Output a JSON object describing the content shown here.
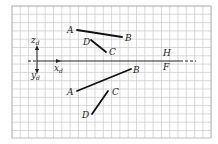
{
  "diagram": {
    "grid": {
      "x0": 12,
      "y0": 6,
      "x1": 211,
      "y1": 138,
      "spacing": 8.3,
      "color": "#c8c8c8",
      "border": "#b0b0b0"
    },
    "axis": {
      "y": 61,
      "solid_from": 37,
      "solid_to": 180,
      "dashed_before_from": 28,
      "dashed_after_to": 196
    },
    "coordinate_labels": {
      "z": {
        "main": "z",
        "sub": "d"
      },
      "y": {
        "main": "y",
        "sub": "d"
      },
      "x": {
        "main": "x",
        "sub": "d"
      }
    },
    "plane_labels": {
      "upper": "H",
      "lower": "F"
    },
    "top_view": {
      "segments": [
        {
          "name": "AB",
          "from": [
            77,
            30
          ],
          "to": [
            122,
            37
          ]
        },
        {
          "name": "DC",
          "from": [
            91,
            40
          ],
          "to": [
            106,
            52
          ]
        }
      ],
      "points": [
        {
          "label": "A",
          "x": 67,
          "y": 33
        },
        {
          "label": "B",
          "x": 125,
          "y": 41
        },
        {
          "label": "D",
          "x": 83,
          "y": 45
        },
        {
          "label": "C",
          "x": 109,
          "y": 55
        }
      ]
    },
    "front_view": {
      "segments": [
        {
          "name": "AB",
          "from": [
            77,
            91
          ],
          "to": [
            131,
            69
          ]
        },
        {
          "name": "CD",
          "from": [
            108,
            91
          ],
          "to": [
            92,
            114
          ]
        }
      ],
      "points": [
        {
          "label": "B",
          "x": 133,
          "y": 73
        },
        {
          "label": "A",
          "x": 67,
          "y": 95
        },
        {
          "label": "C",
          "x": 112,
          "y": 95
        },
        {
          "label": "D",
          "x": 82,
          "y": 118
        }
      ]
    }
  }
}
